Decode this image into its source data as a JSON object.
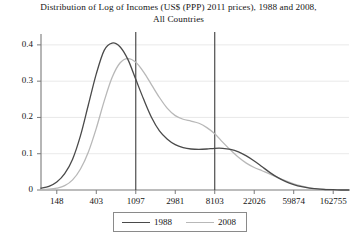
{
  "chart_data": {
    "type": "line",
    "title": "Distribution of Log of Incomes (US$ (PPP) 2011 prices), 1988 and 2008, All Countries",
    "title_line_1": "Distribution of Log of Incomes (US$ (PPP) 2011 prices), 1988 and 2008,",
    "title_line_2": "All Countries",
    "xlabel": "",
    "ylabel": "",
    "grid": true,
    "legend_position": "bottom-center",
    "xlim": [
      4.6,
      12.4
    ],
    "ylim": [
      0,
      0.43
    ],
    "x_tick_labels": [
      "148",
      "403",
      "1097",
      "2981",
      "8103",
      "22026",
      "59874",
      "162755"
    ],
    "x_tick_log_values": [
      5,
      6,
      7,
      8,
      9,
      10,
      11,
      12
    ],
    "y_tick_labels": [
      "0",
      "0.1",
      "0.2",
      "0.3",
      "0.4"
    ],
    "y_tick_values": [
      0,
      0.1,
      0.2,
      0.3,
      0.4
    ],
    "annotations": [
      {
        "name": "vertical-line-1097",
        "x_label": "1097",
        "x_log_value": 7
      },
      {
        "name": "vertical-line-8103",
        "x_label": "8103",
        "x_log_value": 9
      }
    ],
    "series": [
      {
        "name": "1988",
        "color": "#4a4a4a",
        "x": [
          4.6,
          4.8,
          5.0,
          5.2,
          5.4,
          5.6,
          5.8,
          6.0,
          6.2,
          6.4,
          6.6,
          6.8,
          7.0,
          7.2,
          7.4,
          7.6,
          7.8,
          8.0,
          8.2,
          8.4,
          8.6,
          8.8,
          9.0,
          9.2,
          9.4,
          9.6,
          9.8,
          10.0,
          10.2,
          10.4,
          10.6,
          10.8,
          11.0,
          11.2,
          11.4,
          11.6,
          11.8,
          12.0,
          12.2,
          12.4
        ],
        "values": [
          0.005,
          0.01,
          0.022,
          0.045,
          0.085,
          0.15,
          0.235,
          0.32,
          0.385,
          0.405,
          0.395,
          0.36,
          0.305,
          0.25,
          0.2,
          0.163,
          0.14,
          0.125,
          0.117,
          0.113,
          0.112,
          0.113,
          0.115,
          0.115,
          0.112,
          0.105,
          0.094,
          0.08,
          0.064,
          0.048,
          0.034,
          0.023,
          0.015,
          0.009,
          0.005,
          0.003,
          0.001,
          0.001,
          0.0,
          0.0
        ]
      },
      {
        "name": "2008",
        "color": "#b8b8b8",
        "x": [
          4.6,
          4.8,
          5.0,
          5.2,
          5.4,
          5.6,
          5.8,
          6.0,
          6.2,
          6.4,
          6.6,
          6.8,
          7.0,
          7.2,
          7.4,
          7.6,
          7.8,
          8.0,
          8.2,
          8.4,
          8.6,
          8.8,
          9.0,
          9.2,
          9.4,
          9.6,
          9.8,
          10.0,
          10.2,
          10.4,
          10.6,
          10.8,
          11.0,
          11.2,
          11.4,
          11.6,
          11.8,
          12.0,
          12.2,
          12.4
        ],
        "values": [
          0.001,
          0.002,
          0.005,
          0.012,
          0.028,
          0.058,
          0.105,
          0.17,
          0.245,
          0.31,
          0.35,
          0.362,
          0.352,
          0.325,
          0.29,
          0.255,
          0.225,
          0.205,
          0.195,
          0.19,
          0.184,
          0.172,
          0.155,
          0.132,
          0.11,
          0.09,
          0.074,
          0.062,
          0.053,
          0.044,
          0.034,
          0.025,
          0.017,
          0.011,
          0.006,
          0.003,
          0.002,
          0.001,
          0.0,
          0.0
        ]
      }
    ]
  },
  "legend": {
    "entries": [
      {
        "label": "1988",
        "color": "#4a4a4a"
      },
      {
        "label": "2008",
        "color": "#b8b8b8"
      }
    ]
  },
  "caption_fragment": ""
}
